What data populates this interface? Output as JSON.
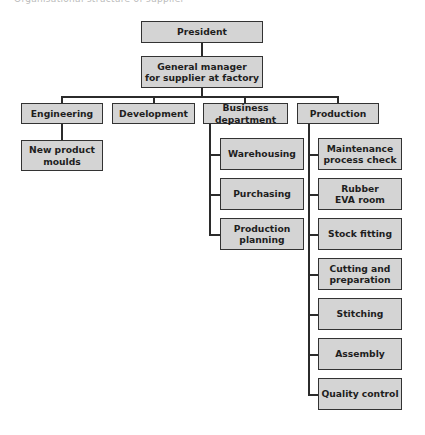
{
  "caption": "Organisational structure of supplier",
  "chart": {
    "root": {
      "label": "President"
    },
    "manager": {
      "label": "General manager\nfor supplier at factory"
    },
    "departments": [
      {
        "label": "Engineering",
        "children": [
          {
            "label": "New product\nmoulds"
          }
        ]
      },
      {
        "label": "Development",
        "children": []
      },
      {
        "label": "Business department",
        "children": [
          {
            "label": "Warehousing"
          },
          {
            "label": "Purchasing"
          },
          {
            "label": "Production\nplanning"
          }
        ]
      },
      {
        "label": "Production",
        "children": [
          {
            "label": "Maintenance\nprocess check"
          },
          {
            "label": "Rubber\nEVA room"
          },
          {
            "label": "Stock fitting"
          },
          {
            "label": "Cutting and\npreparation"
          },
          {
            "label": "Stitching"
          },
          {
            "label": "Assembly"
          },
          {
            "label": "Quality control"
          }
        ]
      }
    ]
  },
  "colors": {
    "box_fill": "#d4d4d4",
    "box_border": "#333333",
    "line": "#2b2b2b"
  }
}
